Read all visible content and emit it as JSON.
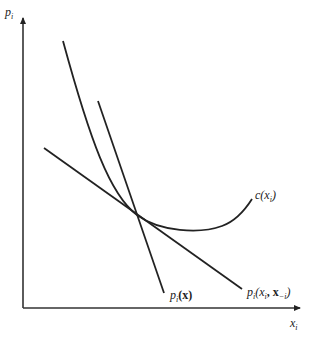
{
  "diagram": {
    "type": "economics-cost-price-diagram",
    "y_axis_label": {
      "base": "p",
      "sub": "i"
    },
    "x_axis_label": {
      "base": "x",
      "sub": "i"
    },
    "curves": [
      {
        "id": "cost-curve",
        "label_base": "c(x",
        "label_sub": "i",
        "label_end": ")",
        "shape": "U-shaped convex curve"
      },
      {
        "id": "aggregate-price-line",
        "label_base": "p",
        "label_sub": "i",
        "label_end": "(x)",
        "shape": "steep downward line"
      },
      {
        "id": "own-price-line",
        "label_base": "p",
        "label_sub": "i",
        "label_mid": "(x",
        "label_sub2": "i",
        "label_mid2": ", x",
        "label_sub3": "−i",
        "label_end": ")",
        "shape": "shallow downward line"
      }
    ],
    "tangency_point": {
      "x": 137,
      "y": 215
    },
    "colors": {
      "line": "#222222",
      "background": "#ffffff"
    }
  }
}
